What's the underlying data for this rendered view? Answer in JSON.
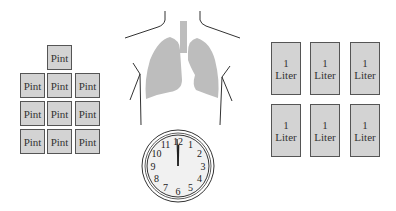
{
  "pints": {
    "label": "Pint",
    "count": 10,
    "items": [
      {
        "label": "Pint"
      },
      {
        "label": "Pint"
      },
      {
        "label": "Pint"
      },
      {
        "label": "Pint"
      },
      {
        "label": "Pint"
      },
      {
        "label": "Pint"
      },
      {
        "label": "Pint"
      },
      {
        "label": "Pint"
      },
      {
        "label": "Pint"
      },
      {
        "label": "Pint"
      }
    ]
  },
  "liters": {
    "count": 6,
    "items": [
      {
        "amount": "1",
        "unit": "Liter"
      },
      {
        "amount": "1",
        "unit": "Liter"
      },
      {
        "amount": "1",
        "unit": "Liter"
      },
      {
        "amount": "1",
        "unit": "Liter"
      },
      {
        "amount": "1",
        "unit": "Liter"
      },
      {
        "amount": "1",
        "unit": "Liter"
      }
    ]
  },
  "clock": {
    "numbers": [
      "12",
      "1",
      "2",
      "3",
      "4",
      "5",
      "6",
      "7",
      "8",
      "9",
      "10",
      "11"
    ],
    "time": "12:00"
  },
  "colors": {
    "box_fill": "#d3d3d3",
    "lung_fill": "#bdbdbd",
    "outline": "#555555"
  }
}
